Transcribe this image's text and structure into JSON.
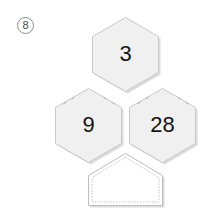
{
  "problem": {
    "number": "8",
    "badge_shape": "circle"
  },
  "colors": {
    "background": "#ffffff",
    "hex_fill": "#f0f0f0",
    "hex_stroke": "#c9c9c9",
    "hex_shadow": "#dcdcdc",
    "answer_fill": "#ffffff",
    "answer_stroke": "#bdbdbd",
    "answer_dashed_stroke": "#c4c4c4",
    "label_text": "#141414",
    "badge_text": "#4a4a4a",
    "badge_stroke": "#8d8d8d"
  },
  "diagram": {
    "type": "hexagon-number-puzzle",
    "cells": [
      {
        "id": "hex-top",
        "label": "3",
        "position": "top",
        "filled": true,
        "cx": 125.5,
        "cy": 55.5,
        "radius": 38
      },
      {
        "id": "hex-bottom-left",
        "label": "9",
        "position": "bottom-left",
        "filled": true,
        "cx": 88.5,
        "cy": 126.5,
        "radius": 38
      },
      {
        "id": "hex-bottom-right",
        "label": "28",
        "position": "bottom-right",
        "filled": true,
        "cx": 162.5,
        "cy": 126.5,
        "radius": 38
      }
    ],
    "answer_slot": {
      "id": "answer-pentagon",
      "label": "",
      "position": "bottom-center",
      "filled": false,
      "style": "dashed"
    }
  }
}
